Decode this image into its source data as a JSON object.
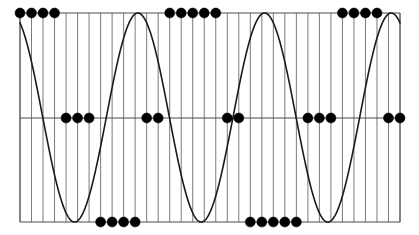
{
  "figure": {
    "title": "",
    "background_color": "#ffffff",
    "width": 419,
    "height": 235
  },
  "axes": {
    "frame_color": "#4d4d4d",
    "frame_line_width": 1.0,
    "left_px": 20,
    "right_px": 400,
    "top_px": 13,
    "bottom_px": 222,
    "midline_px": 118,
    "xlabel": "",
    "ylabel": "",
    "xticks_visible": false,
    "yticks_visible": false,
    "tick_labels_x": [],
    "tick_labels_y": []
  },
  "gridlines": {
    "orientation": "vertical",
    "color": "#595959",
    "line_width": 0.8,
    "count": 34,
    "spacing_px": 11.5,
    "horizontal_midline": true,
    "horizontal_midline_color": "#4d4d4d"
  },
  "curve": {
    "label": "continuous sine",
    "color": "#1a1a1a",
    "line_width": 1.6,
    "style": "solid",
    "fill": "none"
  },
  "markers": {
    "label": "quantized samples",
    "color": "#000000",
    "shape": "circle",
    "radius_px": 5.0,
    "edge_color": "#000000"
  },
  "chart_data": {
    "type": "line",
    "title": "",
    "subtitle": "",
    "xlabel": "",
    "ylabel": "",
    "xlim": [
      0,
      34
    ],
    "ylim": [
      -1.15,
      1.15
    ],
    "grid": true,
    "grid_axis": "x",
    "legend": false,
    "legend_position": "none",
    "annotations": [],
    "series": [
      {
        "name": "sine",
        "type": "line",
        "kind": "continuous",
        "amplitude": 1.0,
        "periods": 3.0,
        "phase_deg": 115,
        "samples_per_period": 11.3,
        "x": [
          0,
          0.25,
          0.5,
          0.75,
          1,
          1.25,
          1.5,
          1.75,
          2,
          2.25,
          2.5,
          2.75,
          3,
          3.25,
          3.5,
          3.75,
          4,
          4.25,
          4.5,
          4.75,
          5,
          5.25,
          5.5,
          5.75,
          6,
          6.25,
          6.5,
          6.75,
          7,
          7.25,
          7.5,
          7.75,
          8,
          8.25,
          8.5,
          8.75,
          9,
          9.25,
          9.5,
          9.75,
          10,
          10.25,
          10.5,
          10.75,
          11,
          11.25,
          11.5,
          11.75,
          12,
          12.25,
          12.5,
          12.75,
          13,
          13.25,
          13.5,
          13.75,
          14,
          14.25,
          14.5,
          14.75,
          15,
          15.25,
          15.5,
          15.75,
          16,
          16.25,
          16.5,
          16.75,
          17,
          17.25,
          17.5,
          17.75,
          18,
          18.25,
          18.5,
          18.75,
          19,
          19.25,
          19.5,
          19.75,
          20,
          20.25,
          20.5,
          20.75,
          21,
          21.25,
          21.5,
          21.75,
          22,
          22.25,
          22.5,
          22.75,
          23,
          23.25,
          23.5,
          23.75,
          24,
          24.25,
          24.5,
          24.75,
          25,
          25.25,
          25.5,
          25.75,
          26,
          26.25,
          26.5,
          26.75,
          27,
          27.25,
          27.5,
          27.75,
          28,
          28.25,
          28.5,
          28.75,
          29,
          29.25,
          29.5,
          29.75,
          30,
          30.25,
          30.5,
          30.75,
          31,
          31.25,
          31.5,
          31.75,
          32,
          32.25,
          32.5,
          32.75,
          33
        ]
      },
      {
        "name": "quantized samples",
        "type": "scatter",
        "kind": "discrete",
        "quantization_levels": [
          1,
          0,
          -1
        ],
        "x": [
          0,
          1,
          2,
          3,
          4,
          5,
          6,
          7,
          8,
          9,
          10,
          11,
          12,
          13,
          14,
          15,
          16,
          17,
          18,
          19,
          20,
          21,
          22,
          23,
          24,
          25,
          26,
          27,
          28,
          29,
          30,
          31,
          32,
          33
        ],
        "values": [
          1,
          1,
          1,
          1,
          0,
          0,
          0,
          -1,
          -1,
          -1,
          -1,
          0,
          0,
          1,
          1,
          1,
          1,
          1,
          0,
          0,
          -1,
          -1,
          -1,
          -1,
          -1,
          0,
          0,
          0,
          1,
          1,
          1,
          1,
          0,
          0
        ]
      }
    ]
  }
}
